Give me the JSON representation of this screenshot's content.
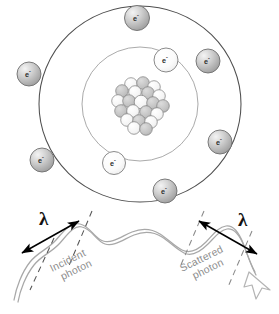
{
  "figure": {
    "background": "#ffffff"
  },
  "atom": {
    "name": "bohr-atom",
    "center": {
      "x": 140,
      "y": 104
    },
    "nucleus": {
      "name": "nucleus",
      "label": "nucleus-cluster",
      "particle_count": 21,
      "particle_radius": 6.2,
      "colors": {
        "light": "#f2f2f2",
        "dark": "#bdbdbd",
        "stroke": "#7a7a7a"
      },
      "particles": [
        {
          "x": 131,
          "y": 84,
          "shade": "light"
        },
        {
          "x": 143,
          "y": 83,
          "shade": "dark"
        },
        {
          "x": 154,
          "y": 87,
          "shade": "light"
        },
        {
          "x": 122,
          "y": 91,
          "shade": "dark"
        },
        {
          "x": 135,
          "y": 92,
          "shade": "light"
        },
        {
          "x": 148,
          "y": 93,
          "shade": "dark"
        },
        {
          "x": 159,
          "y": 96,
          "shade": "light"
        },
        {
          "x": 118,
          "y": 101,
          "shade": "light"
        },
        {
          "x": 129,
          "y": 101,
          "shade": "dark"
        },
        {
          "x": 141,
          "y": 102,
          "shade": "light"
        },
        {
          "x": 153,
          "y": 103,
          "shade": "dark"
        },
        {
          "x": 163,
          "y": 106,
          "shade": "dark"
        },
        {
          "x": 121,
          "y": 111,
          "shade": "dark"
        },
        {
          "x": 133,
          "y": 111,
          "shade": "light"
        },
        {
          "x": 146,
          "y": 112,
          "shade": "dark"
        },
        {
          "x": 157,
          "y": 114,
          "shade": "light"
        },
        {
          "x": 127,
          "y": 120,
          "shade": "light"
        },
        {
          "x": 139,
          "y": 121,
          "shade": "dark"
        },
        {
          "x": 151,
          "y": 122,
          "shade": "light"
        },
        {
          "x": 134,
          "y": 128,
          "shade": "light"
        },
        {
          "x": 146,
          "y": 129,
          "shade": "dark"
        }
      ]
    },
    "orbits": [
      {
        "name": "inner-orbit",
        "rx": 58,
        "ry": 57,
        "stroke": "#9a9a9a",
        "stroke_width": 0.9
      },
      {
        "name": "outer-orbit",
        "rx": 101,
        "ry": 98,
        "stroke": "#4f4f4f",
        "stroke_width": 1.1
      }
    ],
    "electron_label": "e",
    "electron_charge": "-",
    "electrons": [
      {
        "id": "outer-top",
        "shell": "outer",
        "x": 137,
        "y": 18,
        "r": 12.5,
        "fill": "gray"
      },
      {
        "id": "outer-upper-right",
        "shell": "outer",
        "x": 208,
        "y": 61,
        "r": 12.0,
        "fill": "gray"
      },
      {
        "id": "outer-lower-right",
        "shell": "outer",
        "x": 220,
        "y": 142,
        "r": 12.0,
        "fill": "gray"
      },
      {
        "id": "outer-bottom",
        "shell": "outer",
        "x": 165,
        "y": 191,
        "r": 12.0,
        "fill": "gray"
      },
      {
        "id": "outer-lower-left",
        "shell": "outer",
        "x": 42,
        "y": 160,
        "r": 12.0,
        "fill": "gray"
      },
      {
        "id": "outer-upper-left",
        "shell": "outer",
        "x": 29,
        "y": 74,
        "r": 12.0,
        "fill": "gray"
      },
      {
        "id": "inner-top-right",
        "shell": "inner",
        "x": 166,
        "y": 60,
        "r": 12.0,
        "fill": "white"
      },
      {
        "id": "inner-bottom-left",
        "shell": "inner",
        "x": 114,
        "y": 163,
        "r": 11.5,
        "fill": "white"
      }
    ]
  },
  "photons": {
    "wave_stroke": "#a8a8a8",
    "incident": {
      "name": "incident-photon",
      "label": "Incident\nphoton",
      "label_line1": "Incident",
      "label_line2": "photon",
      "label_rotation_deg": -26
    },
    "scattered": {
      "name": "scattered-photon",
      "label_line1": "Scattered",
      "label_line2": "photon",
      "label_rotation_deg": -26
    }
  },
  "measurements": [
    {
      "id": "incident-wavelength",
      "name": "incident-wavelength-measure",
      "symbol": "λ",
      "arrow": "double-headed",
      "arrow_color": "#000000",
      "dash_color": "#555555"
    },
    {
      "id": "scattered-wavelength",
      "name": "scattered-wavelength-measure",
      "symbol": "λ",
      "arrow": "double-headed",
      "arrow_color": "#000000",
      "dash_color": "#8a8a8a"
    }
  ]
}
